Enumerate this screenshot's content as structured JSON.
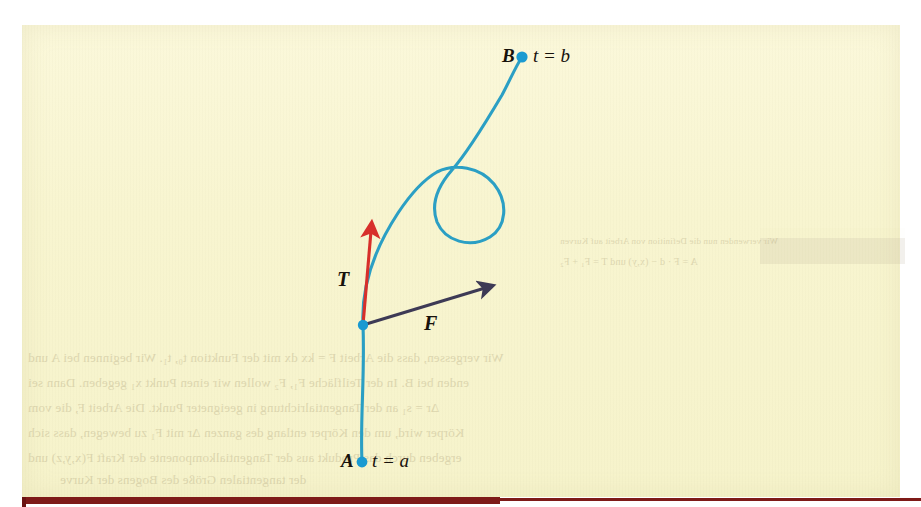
{
  "figure": {
    "kind": "space-curve-diagram",
    "background_color": "#f8f5cf",
    "curve_color": "#2b9fc4",
    "tangent_vector_color": "#d72f2a",
    "force_vector_color": "#3d3a55",
    "point_marker_color": "#1a9ad1",
    "rule_color": "#7e1a18",
    "endpoint_start": {
      "point_label": "A",
      "parameter_label": "t = a",
      "x": 362,
      "y": 462
    },
    "endpoint_end": {
      "point_label": "B",
      "parameter_label": "t = b",
      "x": 522,
      "y": 57
    },
    "sample_point": {
      "x": 363,
      "y": 325
    },
    "vectors": [
      {
        "name": "tangent",
        "label": "T",
        "from_x": 363,
        "from_y": 325,
        "to_x": 371,
        "to_y": 231
      },
      {
        "name": "force",
        "label": "F",
        "from_x": 363,
        "from_y": 325,
        "to_x": 485,
        "to_y": 288
      }
    ],
    "curve_path": "M 362 462 C 360 420 365 375 363 325 C 361 285 375 248 398 213 C 416 186 430 176 437 172 C 455 163 480 167 494 184 C 509 203 506 227 490 237 C 470 249 445 241 437 222 C 430 203 438 186 452 170 C 468 152 486 122 502 95 C 510 80 516 66 522 57",
    "loop": {
      "center_x": 463,
      "center_y": 203,
      "radius_x": 38,
      "radius_y": 37
    }
  },
  "bleed_through": {
    "description": "faint mirrored text showing through the scanned page",
    "lines": [
      {
        "text": "Wir verwenden nun die Definition von Arbeit auf Kurven",
        "x": 560,
        "y": 236,
        "size": 9
      },
      {
        "text": "A = F · d − (x,y) und T = F₁ + F₂",
        "x": 560,
        "y": 258,
        "size": 10
      },
      {
        "text": "Wir vergessen, dass die Arbeit F = kx dx mit der Funktion t₀, t₁. Wir beginnen bei A und",
        "x": 30,
        "y": 356,
        "size": 12
      },
      {
        "text": "enden bei B. In der Teilfläche F₁, F₂ wollen wir einen Punkt x₁ gegeben. Dann sei",
        "x": 30,
        "y": 381,
        "size": 12
      },
      {
        "text": "Δr = s₁ an der Tangentialrichtung in geeigneter Punkt. Die Arbeit F, die vom",
        "x": 30,
        "y": 406,
        "size": 12
      },
      {
        "text": "Körper wird, um den Körper entlang des ganzen Δr mit F₁ zu bewegen, dass sich",
        "x": 30,
        "y": 431,
        "size": 12
      },
      {
        "text": "ergeben durch das Produkt aus der Tangentialkomponente der Kraft F(x,y,z) und",
        "x": 30,
        "y": 456,
        "size": 12
      },
      {
        "text": "der tangentialen Größe des Bogens der Kurve",
        "x": 70,
        "y": 481,
        "size": 12
      }
    ]
  }
}
